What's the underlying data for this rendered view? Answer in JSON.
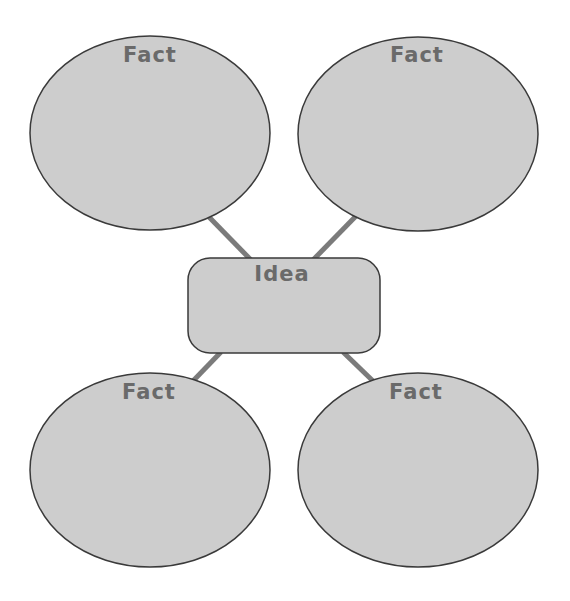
{
  "diagram": {
    "type": "idea web / graphic organizer",
    "colors": {
      "fill": "#cdcdcd",
      "outline": "#3a3a3a",
      "connector": "#7b7b7b",
      "text": "#6a6a6a",
      "background": "#ffffff"
    },
    "center": {
      "label": "Idea",
      "shape": "rounded-rectangle",
      "x": 188,
      "y": 258,
      "width": 192,
      "height": 95,
      "radius": 22
    },
    "nodes": [
      {
        "id": "fact-top-left",
        "label": "Fact",
        "cx": 150,
        "cy": 133,
        "rx": 120,
        "ry": 97
      },
      {
        "id": "fact-top-right",
        "label": "Fact",
        "cx": 418,
        "cy": 134,
        "rx": 120,
        "ry": 97
      },
      {
        "id": "fact-bottom-left",
        "label": "Fact",
        "cx": 150,
        "cy": 470,
        "rx": 120,
        "ry": 97
      },
      {
        "id": "fact-bottom-right",
        "label": "Fact",
        "cx": 418,
        "cy": 470,
        "rx": 120,
        "ry": 97
      }
    ],
    "connectors": [
      {
        "from": "center",
        "to": "fact-top-left",
        "x1": 251,
        "y1": 260,
        "x2": 209,
        "y2": 217
      },
      {
        "from": "center",
        "to": "fact-top-right",
        "x1": 313,
        "y1": 260,
        "x2": 357,
        "y2": 215
      },
      {
        "from": "center",
        "to": "fact-bottom-left",
        "x1": 221,
        "y1": 352,
        "x2": 193,
        "y2": 381
      },
      {
        "from": "center",
        "to": "fact-bottom-right",
        "x1": 343,
        "y1": 352,
        "x2": 374,
        "y2": 382
      }
    ]
  }
}
